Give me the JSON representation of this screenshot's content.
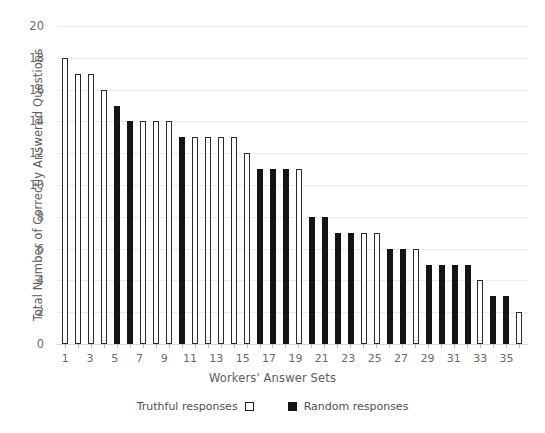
{
  "chart_data": {
    "type": "bar",
    "title": "",
    "xlabel": "Workers' Answer Sets",
    "ylabel": "Total Number of Correctly Answered Questions",
    "ylim": [
      0,
      20
    ],
    "ytick_step": 2,
    "yticks": [
      20,
      18,
      16,
      14,
      12,
      10,
      8,
      6,
      4,
      2,
      0
    ],
    "grid": true,
    "grid_axis": "y",
    "legend_position": "bottom",
    "categories": [
      1,
      2,
      3,
      4,
      5,
      6,
      7,
      8,
      9,
      10,
      11,
      12,
      13,
      14,
      15,
      16,
      17,
      18,
      19,
      20,
      21,
      22,
      23,
      24,
      25,
      26,
      27,
      28,
      29,
      30,
      31,
      32,
      33,
      34,
      35,
      36
    ],
    "xtick_labels": [
      "1",
      "",
      "3",
      "",
      "5",
      "",
      "7",
      "",
      "9",
      "",
      "11",
      "",
      "13",
      "",
      "15",
      "",
      "17",
      "",
      "19",
      "",
      "21",
      "",
      "23",
      "",
      "25",
      "",
      "27",
      "",
      "29",
      "",
      "31",
      "",
      "33",
      "",
      "35",
      ""
    ],
    "values": [
      18,
      17,
      17,
      16,
      15,
      14,
      14,
      14,
      14,
      13,
      13,
      13,
      13,
      13,
      12,
      11,
      11,
      11,
      11,
      8,
      8,
      7,
      7,
      7,
      7,
      6,
      6,
      6,
      5,
      5,
      5,
      5,
      4,
      3,
      3,
      2
    ],
    "series_of_bar": [
      "truthful",
      "truthful",
      "truthful",
      "truthful",
      "random",
      "random",
      "truthful",
      "truthful",
      "truthful",
      "random",
      "truthful",
      "truthful",
      "truthful",
      "truthful",
      "truthful",
      "random",
      "random",
      "random",
      "truthful",
      "random",
      "random",
      "random",
      "random",
      "truthful",
      "truthful",
      "random",
      "random",
      "truthful",
      "random",
      "random",
      "random",
      "random",
      "truthful",
      "random",
      "random",
      "truthful"
    ],
    "series": [
      {
        "name": "Truthful responses",
        "style": "white-filled-black-outline",
        "color": "#ffffff",
        "edge_color": "#2a2a2a",
        "points": [
          {
            "x": 1,
            "y": 18
          },
          {
            "x": 2,
            "y": 17
          },
          {
            "x": 3,
            "y": 17
          },
          {
            "x": 4,
            "y": 16
          },
          {
            "x": 7,
            "y": 14
          },
          {
            "x": 8,
            "y": 14
          },
          {
            "x": 9,
            "y": 14
          },
          {
            "x": 11,
            "y": 13
          },
          {
            "x": 12,
            "y": 13
          },
          {
            "x": 13,
            "y": 13
          },
          {
            "x": 14,
            "y": 13
          },
          {
            "x": 15,
            "y": 12
          },
          {
            "x": 19,
            "y": 11
          },
          {
            "x": 24,
            "y": 7
          },
          {
            "x": 25,
            "y": 7
          },
          {
            "x": 28,
            "y": 6
          },
          {
            "x": 33,
            "y": 4
          },
          {
            "x": 36,
            "y": 2
          }
        ]
      },
      {
        "name": "Random responses",
        "style": "black-filled",
        "color": "#141414",
        "edge_color": "#141414",
        "points": [
          {
            "x": 5,
            "y": 15
          },
          {
            "x": 6,
            "y": 14
          },
          {
            "x": 10,
            "y": 13
          },
          {
            "x": 16,
            "y": 11
          },
          {
            "x": 17,
            "y": 11
          },
          {
            "x": 18,
            "y": 11
          },
          {
            "x": 20,
            "y": 8
          },
          {
            "x": 21,
            "y": 8
          },
          {
            "x": 22,
            "y": 7
          },
          {
            "x": 23,
            "y": 7
          },
          {
            "x": 26,
            "y": 6
          },
          {
            "x": 27,
            "y": 6
          },
          {
            "x": 29,
            "y": 5
          },
          {
            "x": 30,
            "y": 5
          },
          {
            "x": 31,
            "y": 5
          },
          {
            "x": 32,
            "y": 5
          },
          {
            "x": 34,
            "y": 3
          },
          {
            "x": 35,
            "y": 3
          }
        ]
      }
    ]
  },
  "legend": {
    "truthful_label": "Truthful responses",
    "random_label": "Random responses"
  },
  "colors": {
    "bar_outline": "#2a2a2a",
    "bar_fill_random": "#141414",
    "gridline": "#eceaea",
    "text": "#5d5d5d",
    "background": "#ffffff"
  }
}
